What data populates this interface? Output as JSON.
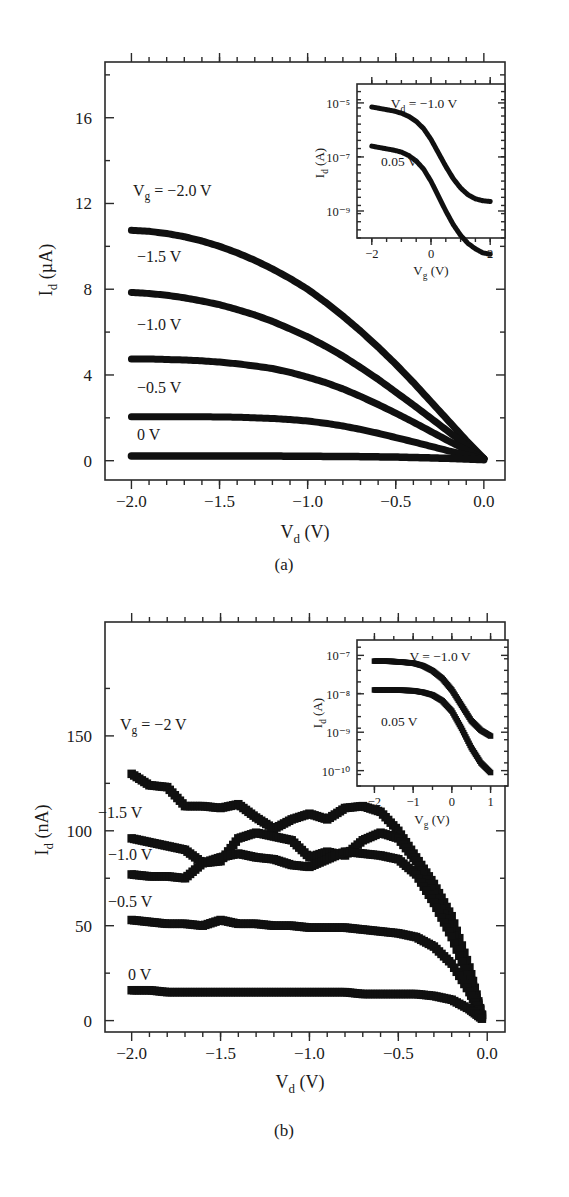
{
  "figure": {
    "panels": [
      {
        "id": "panel-a",
        "caption": "(a)",
        "axes": {
          "xlabel_main": "V",
          "xlabel_sub": "d",
          "xlabel_unit": "(V)",
          "ylabel_main": "I",
          "ylabel_sub": "d",
          "ylabel_unit": "(µA)",
          "xticks": [
            "−2.0",
            "−1.5",
            "−1.0",
            "−0.5",
            "0.0"
          ],
          "xtick_values": [
            -2.0,
            -1.5,
            -1.0,
            -0.5,
            0.0
          ],
          "yticks": [
            "0",
            "4",
            "8",
            "12",
            "16"
          ],
          "ytick_values": [
            0,
            4,
            8,
            12,
            16
          ],
          "xlim": [
            -2.15,
            0.12
          ],
          "ylim": [
            -0.9,
            18.6
          ]
        },
        "series_labels": [
          "V_g = −2.0 V",
          "−1.5 V",
          "−1.0 V",
          "−0.5 V",
          "0 V"
        ],
        "inset": {
          "axes": {
            "xlabel_main": "V",
            "xlabel_sub": "g",
            "xlabel_unit": "(V)",
            "ylabel_main": "I",
            "ylabel_sub": "d",
            "ylabel_unit": "(A)",
            "xticks": [
              "−2",
              "0",
              "2"
            ],
            "xtick_values": [
              -2,
              0,
              2
            ],
            "yticks": [
              "10⁻⁵",
              "10⁻⁷",
              "10⁻⁹"
            ],
            "ytick_exponents": [
              -5,
              -7,
              -9
            ],
            "xlim": [
              -2.5,
              2.5
            ],
            "ylim": [
              -10.0,
              -4.3
            ]
          },
          "series_labels": [
            "V_d = −1.0 V",
            "0.05 V"
          ]
        }
      },
      {
        "id": "panel-b",
        "caption": "(b)",
        "axes": {
          "xlabel_main": "V",
          "xlabel_sub": "d",
          "xlabel_unit": "(V)",
          "ylabel_main": "I",
          "ylabel_sub": "d",
          "ylabel_unit": "(nA)",
          "xticks": [
            "−2.0",
            "−1.5",
            "−1.0",
            "−0.5",
            "0.0"
          ],
          "xtick_values": [
            -2.0,
            -1.5,
            -1.0,
            -0.5,
            0.0
          ],
          "yticks": [
            "0",
            "50",
            "100",
            "150"
          ],
          "ytick_values": [
            0,
            50,
            100,
            150
          ],
          "xlim": [
            -2.15,
            0.1
          ],
          "ylim": [
            -6,
            210
          ]
        },
        "series_labels": [
          "V_g = −2 V",
          "−1.5 V",
          "−1.0 V",
          "−0.5 V",
          "0 V"
        ],
        "inset": {
          "axes": {
            "xlabel_main": "V",
            "xlabel_sub": "g",
            "xlabel_unit": "(V)",
            "ylabel_main": "I",
            "ylabel_sub": "d",
            "ylabel_unit": "(A)",
            "xticks": [
              "−2",
              "−1",
              "0",
              "1"
            ],
            "xtick_values": [
              -2,
              -1,
              0,
              1
            ],
            "yticks": [
              "10⁻⁷",
              "10⁻⁸",
              "10⁻⁹",
              "10⁻¹⁰"
            ],
            "ytick_exponents": [
              -7,
              -8,
              -9,
              -10
            ],
            "xlim": [
              -2.45,
              1.45
            ],
            "ylim": [
              -10.4,
              -6.6
            ]
          },
          "series_labels": [
            "V = −1.0 V",
            "0.05 V"
          ]
        }
      }
    ],
    "labels": {
      "a_vg_prefix": "V",
      "a_vg_sub": "g",
      "a_vg_value": "= −2.0 V",
      "a_l2": "−1.5 V",
      "a_l3": "−1.0 V",
      "a_l4": "−0.5 V",
      "a_l5": "0 V",
      "b_vg_prefix": "V",
      "b_vg_sub": "g",
      "b_vg_value": "= −2 V",
      "b_l2": "−1.5 V",
      "b_l3": "−1.0 V",
      "b_l4": "−0.5 V",
      "b_l5": "0 V",
      "a_inset_vd_prefix": "V",
      "a_inset_vd_sub": "d",
      "a_inset_vd_value": "= −1.0 V",
      "a_inset_l2": "0.05 V",
      "b_inset_l1": "V = −1.0 V",
      "b_inset_l2": "0.05 V",
      "caption_a": "(a)",
      "caption_b": "(b)",
      "ylab_I": "I",
      "ylab_d": "d",
      "ylab_uA": "(µA)",
      "ylab_nA": "(nA)",
      "ylab_A": "(A)",
      "xlab_V": "V",
      "xlab_d": "d",
      "xlab_g": "g",
      "xlab_unit": "(V)"
    },
    "colors": {
      "ink": "#1a1a1a",
      "data": "#101010",
      "background": "#ffffff"
    }
  },
  "chart_data": [
    {
      "type": "line",
      "id": "panel-a-main",
      "title": "",
      "xlabel": "V_d (V)",
      "ylabel": "I_d (µA)",
      "xlim": [
        -2.15,
        0.12
      ],
      "ylim": [
        -0.9,
        18.6
      ],
      "xticks": [
        -2.0,
        -1.5,
        -1.0,
        -0.5,
        0.0
      ],
      "yticks": [
        0,
        4,
        8,
        12,
        16
      ],
      "grid": false,
      "legend": "inline-annotations",
      "x": [
        -2.0,
        -1.9,
        -1.8,
        -1.7,
        -1.6,
        -1.5,
        -1.4,
        -1.3,
        -1.2,
        -1.1,
        -1.0,
        -0.9,
        -0.8,
        -0.7,
        -0.6,
        -0.5,
        -0.4,
        -0.3,
        -0.2,
        -0.1,
        0.0
      ],
      "series": [
        {
          "name": "V_g = -2.0 V",
          "values": [
            10.75,
            10.7,
            10.6,
            10.45,
            10.25,
            10.0,
            9.7,
            9.35,
            8.95,
            8.5,
            8.0,
            7.4,
            6.75,
            6.05,
            5.3,
            4.5,
            3.65,
            2.75,
            1.85,
            0.95,
            0.1
          ]
        },
        {
          "name": "V_g = -1.5 V",
          "values": [
            7.85,
            7.8,
            7.72,
            7.6,
            7.45,
            7.28,
            7.05,
            6.8,
            6.5,
            6.15,
            5.78,
            5.35,
            4.88,
            4.35,
            3.8,
            3.2,
            2.6,
            1.98,
            1.35,
            0.72,
            0.1
          ]
        },
        {
          "name": "V_g = -1.0 V",
          "values": [
            4.75,
            4.75,
            4.72,
            4.7,
            4.66,
            4.6,
            4.52,
            4.42,
            4.3,
            4.12,
            3.9,
            3.65,
            3.35,
            3.0,
            2.62,
            2.22,
            1.8,
            1.36,
            0.92,
            0.5,
            0.1
          ]
        },
        {
          "name": "V_g = -0.5 V",
          "values": [
            2.05,
            2.05,
            2.05,
            2.05,
            2.05,
            2.04,
            2.03,
            2.0,
            1.97,
            1.92,
            1.85,
            1.75,
            1.62,
            1.46,
            1.28,
            1.08,
            0.88,
            0.67,
            0.46,
            0.27,
            0.08
          ]
        },
        {
          "name": "V_g = 0 V",
          "values": [
            0.22,
            0.22,
            0.22,
            0.22,
            0.22,
            0.22,
            0.22,
            0.22,
            0.22,
            0.21,
            0.21,
            0.2,
            0.2,
            0.19,
            0.18,
            0.17,
            0.15,
            0.13,
            0.11,
            0.08,
            0.05
          ]
        }
      ]
    },
    {
      "type": "line",
      "id": "panel-a-inset",
      "title": "",
      "xlabel": "V_g (V)",
      "ylabel": "I_d (A)",
      "yscale": "log",
      "xlim": [
        -2.5,
        2.5
      ],
      "ylim": [
        1e-10,
        5e-05
      ],
      "xticks": [
        -2,
        0,
        2
      ],
      "yticks": [
        1e-05,
        1e-07,
        1e-09
      ],
      "grid": false,
      "x": [
        -2.0,
        -1.75,
        -1.5,
        -1.25,
        -1.0,
        -0.75,
        -0.5,
        -0.25,
        0.0,
        0.25,
        0.5,
        0.75,
        1.0,
        1.25,
        1.5,
        1.75,
        2.0
      ],
      "series": [
        {
          "name": "V_d = -1.0 V",
          "log10_values": [
            -5.15,
            -5.2,
            -5.25,
            -5.3,
            -5.38,
            -5.5,
            -5.68,
            -5.95,
            -6.35,
            -6.85,
            -7.35,
            -7.8,
            -8.15,
            -8.4,
            -8.55,
            -8.62,
            -8.65
          ]
        },
        {
          "name": "0.05 V",
          "log10_values": [
            -6.6,
            -6.65,
            -6.7,
            -6.75,
            -6.82,
            -6.95,
            -7.15,
            -7.45,
            -7.9,
            -8.45,
            -9.0,
            -9.5,
            -9.9,
            -10.2,
            -10.4,
            -10.55,
            -10.6
          ]
        }
      ]
    },
    {
      "type": "scatter",
      "id": "panel-b-main",
      "title": "",
      "xlabel": "V_d (V)",
      "ylabel": "I_d (nA)",
      "xlim": [
        -2.15,
        0.1
      ],
      "ylim": [
        -6,
        210
      ],
      "xticks": [
        -2.0,
        -1.5,
        -1.0,
        -0.5,
        0.0
      ],
      "yticks": [
        0,
        50,
        100,
        150
      ],
      "grid": false,
      "x": [
        -2.0,
        -1.9,
        -1.8,
        -1.7,
        -1.6,
        -1.5,
        -1.4,
        -1.3,
        -1.2,
        -1.1,
        -1.0,
        -0.9,
        -0.8,
        -0.7,
        -0.6,
        -0.5,
        -0.4,
        -0.3,
        -0.2,
        -0.1,
        -0.03
      ],
      "series": [
        {
          "name": "V_g = -2 V",
          "values": [
            130,
            124,
            123,
            113,
            113,
            112,
            114,
            107,
            101,
            106,
            109,
            106,
            112,
            113,
            110,
            100,
            86,
            72,
            55,
            28,
            3
          ]
        },
        {
          "name": "V_g = -1.5 V",
          "values": [
            96,
            94,
            92,
            90,
            83,
            84,
            96,
            99,
            97,
            95,
            86,
            89,
            87,
            95,
            99,
            96,
            84,
            67,
            48,
            24,
            3
          ]
        },
        {
          "name": "V_g = -1.0 V",
          "values": [
            77,
            76,
            76,
            75,
            83,
            86,
            88,
            86,
            85,
            82,
            81,
            85,
            89,
            88,
            87,
            85,
            77,
            62,
            44,
            21,
            3
          ]
        },
        {
          "name": "V_g = -0.5 V",
          "values": [
            53,
            52,
            51,
            51,
            50,
            53,
            51,
            51,
            50,
            50,
            49,
            49,
            49,
            48,
            47,
            46,
            44,
            39,
            30,
            15,
            2
          ]
        },
        {
          "name": "V_g = 0 V",
          "values": [
            16,
            16,
            15,
            15,
            15,
            15,
            15,
            15,
            15,
            15,
            15,
            15,
            15,
            14,
            14,
            14,
            14,
            13,
            11,
            6,
            1
          ]
        }
      ]
    },
    {
      "type": "scatter",
      "id": "panel-b-inset",
      "title": "",
      "xlabel": "V_g (V)",
      "ylabel": "I_d (A)",
      "yscale": "log",
      "xlim": [
        -2.45,
        1.45
      ],
      "ylim": [
        1e-10,
        2.5e-07
      ],
      "xticks": [
        -2,
        -1,
        0,
        1
      ],
      "yticks": [
        1e-07,
        1e-08,
        1e-09,
        1e-10
      ],
      "grid": false,
      "x": [
        -2.0,
        -1.75,
        -1.5,
        -1.25,
        -1.0,
        -0.75,
        -0.5,
        -0.25,
        0.0,
        0.25,
        0.5,
        0.75,
        1.0
      ],
      "series": [
        {
          "name": "V = -1.0 V",
          "log10_values": [
            -7.15,
            -7.15,
            -7.16,
            -7.18,
            -7.2,
            -7.27,
            -7.4,
            -7.6,
            -7.9,
            -8.3,
            -8.7,
            -8.95,
            -9.1
          ]
        },
        {
          "name": "0.05 V",
          "log10_values": [
            -7.9,
            -7.9,
            -7.9,
            -7.91,
            -7.92,
            -7.96,
            -8.03,
            -8.18,
            -8.45,
            -8.9,
            -9.4,
            -9.8,
            -10.05
          ]
        }
      ]
    }
  ]
}
